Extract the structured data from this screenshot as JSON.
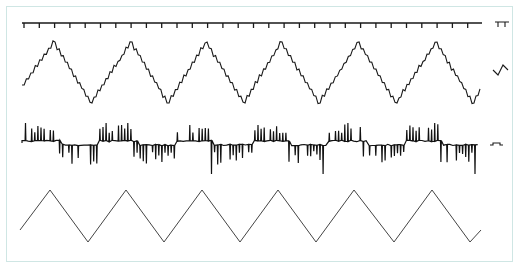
{
  "figure": {
    "frame_color": "#cfe6e4",
    "trace_color": "#1a1a1a",
    "reference_color": "#444444"
  },
  "traces": [
    {
      "name": "timer-marker",
      "kind": "tick-line",
      "y": 23,
      "x_start": 22,
      "x_end": 482,
      "tick_spacing": 15.3,
      "tick_length": 5
    },
    {
      "name": "stepped-triangle",
      "kind": "stepped-triangle",
      "x_start": 22,
      "y_start": 85,
      "peaks_x": [
        53,
        130,
        205,
        280,
        357,
        435
      ],
      "troughs_x": [
        90,
        167,
        243,
        318,
        395,
        472
      ],
      "peak_y": 42,
      "trough_y": 103,
      "x_end": 480,
      "y_end": 88
    },
    {
      "name": "spike-train",
      "kind": "spikes",
      "baseline_y": 143,
      "x_start": 22,
      "x_end": 480
    },
    {
      "name": "reference-triangle",
      "kind": "triangle",
      "x_start": 20,
      "y_start": 230,
      "peaks_x": [
        50,
        126,
        202,
        278,
        354,
        432
      ],
      "troughs_x": [
        88,
        164,
        240,
        316,
        394,
        470
      ],
      "peak_y": 190,
      "trough_y": 242,
      "x_end": 481,
      "y_end": 230
    }
  ],
  "calibration_marks": [
    {
      "name": "timer-calibration",
      "glyph": "square-pulse-down",
      "x": 495,
      "y": 22
    },
    {
      "name": "triangle-calibration",
      "glyph": "check-wave",
      "x": 493,
      "y": 70
    },
    {
      "name": "spike-calibration",
      "glyph": "square-pulse-up",
      "x": 490,
      "y": 145
    }
  ]
}
